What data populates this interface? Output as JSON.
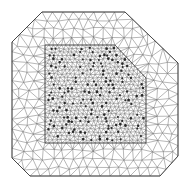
{
  "diagram": {
    "kind": "triangular-finite-element-mesh",
    "canvas": {
      "width": 191,
      "height": 187,
      "background": "#ffffff"
    },
    "colors": {
      "edge": "#6e6e6e",
      "boundary": "#3a3a3a",
      "node_dense": "#2a2a2a"
    },
    "outer_boundary": {
      "description": "Octagon-like outer domain with chamfered corners",
      "polygon": [
        [
          42,
          12
        ],
        [
          125,
          12
        ],
        [
          178,
          63
        ],
        [
          178,
          156
        ],
        [
          160,
          176
        ],
        [
          30,
          176
        ],
        [
          12,
          158
        ],
        [
          12,
          42
        ]
      ],
      "coarse_spacing": 10
    },
    "inner_region": {
      "description": "Refined square subdomain with chamfered top-right corner",
      "polygon": [
        [
          45,
          45
        ],
        [
          115,
          45
        ],
        [
          146,
          78
        ],
        [
          146,
          143
        ],
        [
          45,
          143
        ]
      ],
      "fine_spacing": 4.2,
      "highlighted_node_count": 170
    }
  }
}
